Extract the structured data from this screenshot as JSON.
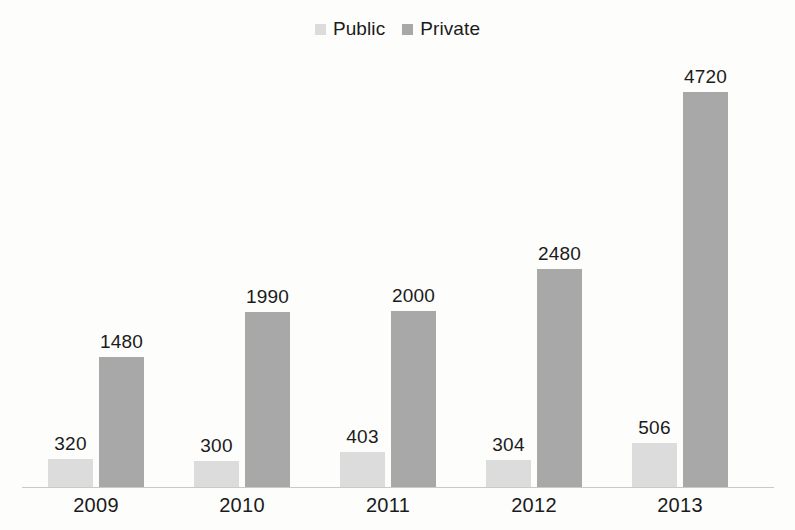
{
  "chart_data": {
    "type": "bar",
    "title": "",
    "subtitle": "",
    "xlabel": "",
    "ylabel": "",
    "categories": [
      "2009",
      "2010",
      "2011",
      "2012",
      "2013"
    ],
    "series": [
      {
        "name": "Public",
        "color": "#dcdcdc",
        "values": [
          320,
          300,
          403,
          304,
          506
        ]
      },
      {
        "name": "Private",
        "color": "#a8a8a8",
        "values": [
          1480,
          1990,
          2000,
          2480,
          4720
        ]
      }
    ],
    "ylim": [
      0,
      4720
    ],
    "grid": false,
    "axis_line": true,
    "value_labels": true,
    "legend_position": "top-center"
  },
  "legend": {
    "entries": [
      {
        "label": "Public",
        "swatch_color": "#dcdcdc"
      },
      {
        "label": "Private",
        "swatch_color": "#a8a8a8"
      }
    ]
  },
  "colors": {
    "public": "#dcdcdc",
    "private": "#a8a8a8",
    "text": "#1b1b1b",
    "axis": "#c9c9c6",
    "background": "#fdfdfc"
  },
  "groups": [
    {
      "year": "2009",
      "bars": [
        {
          "series": "Public",
          "value": "320",
          "number": 320
        },
        {
          "series": "Private",
          "value": "1480",
          "number": 1480
        }
      ]
    },
    {
      "year": "2010",
      "bars": [
        {
          "series": "Public",
          "value": "300",
          "number": 300
        },
        {
          "series": "Private",
          "value": "1990",
          "number": 1990
        }
      ]
    },
    {
      "year": "2011",
      "bars": [
        {
          "series": "Public",
          "value": "403",
          "number": 403
        },
        {
          "series": "Private",
          "value": "2000",
          "number": 2000
        }
      ]
    },
    {
      "year": "2012",
      "bars": [
        {
          "series": "Public",
          "value": "304",
          "number": 304
        },
        {
          "series": "Private",
          "value": "2480",
          "number": 2480
        }
      ]
    },
    {
      "year": "2013",
      "bars": [
        {
          "series": "Public",
          "value": "506",
          "number": 506
        },
        {
          "series": "Private",
          "value": "4720",
          "number": 4720
        }
      ]
    }
  ]
}
